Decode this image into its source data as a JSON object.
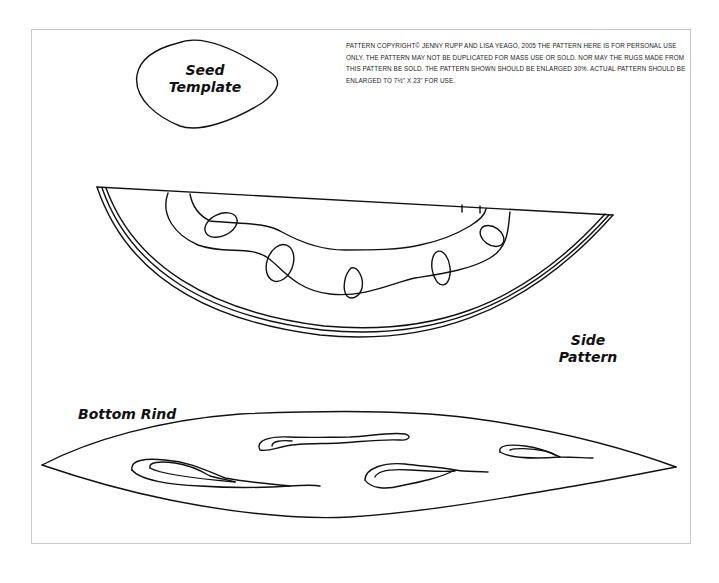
{
  "notice": {
    "text": "PATTERN COPYRIGHT© JENNY RUPP AND LISA YEAGO, 2005 THE PATTERN HERE IS FOR PERSONAL USE ONLY. THE PATTERN MAY NOT BE DUPLICATED FOR MASS USE OR SOLD. NOR MAY THE RUGS MADE FROM THIS PATTERN BE SOLD. THE PATTERN SHOWN SHOULD BE ENLARGED 30%. ACTUAL PATTERN SHOULD BE ENLARGED TO 7½\" X 23\" FOR USE."
  },
  "labels": {
    "seed_line1": "Seed",
    "seed_line2": "Template",
    "side_line1": "Side",
    "side_line2": "Pattern",
    "bottom": "Bottom Rind"
  },
  "colors": {
    "ink": "#111111",
    "frame": "#c8c8c8",
    "paper": "#ffffff"
  }
}
